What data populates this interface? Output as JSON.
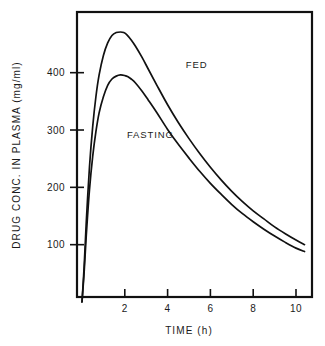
{
  "chart_data": {
    "type": "line",
    "title": "",
    "xlabel": "TIME (h)",
    "ylabel": "DRUG CONC. IN PLASMA  (mg/ml)",
    "xlim": [
      0,
      10.4
    ],
    "ylim": [
      0,
      520
    ],
    "xticks": [
      2,
      4,
      6,
      8,
      10
    ],
    "xtick_labels": [
      "2",
      "4",
      "6",
      "8",
      "10"
    ],
    "yticks": [
      100,
      200,
      300,
      400
    ],
    "ytick_labels": [
      "100",
      "200",
      "300",
      "400"
    ],
    "grid": false,
    "legend": "inline-annotations",
    "line_color": "#111111",
    "frame_color": "#111111",
    "background": "#ffffff",
    "annotations": [
      {
        "text": "FED",
        "x": 4.85,
        "y": 408
      },
      {
        "text": "FASTING",
        "x": 2.1,
        "y": 286
      }
    ],
    "series": [
      {
        "name": "FED",
        "label": "FED",
        "x": [
          0.0,
          0.1,
          0.2,
          0.35,
          0.5,
          0.65,
          0.8,
          1.0,
          1.2,
          1.4,
          1.6,
          1.8,
          1.95,
          2.1,
          2.3,
          2.5,
          2.8,
          3.1,
          3.5,
          4.0,
          4.5,
          5.0,
          5.5,
          6.0,
          6.5,
          7.0,
          7.5,
          8.0,
          8.5,
          9.0,
          9.5,
          10.0,
          10.4
        ],
        "y": [
          0,
          62,
          140,
          236,
          306,
          358,
          396,
          430,
          452,
          465,
          470,
          471,
          470,
          466,
          457,
          446,
          427,
          406,
          378,
          344,
          313,
          285,
          259,
          235,
          213,
          193,
          175,
          159,
          145,
          131,
          119,
          108,
          100
        ]
      },
      {
        "name": "FASTING",
        "label": "FASTING",
        "x": [
          0.0,
          0.1,
          0.2,
          0.35,
          0.5,
          0.65,
          0.8,
          1.0,
          1.2,
          1.4,
          1.6,
          1.8,
          2.0,
          2.15,
          2.3,
          2.5,
          2.8,
          3.1,
          3.5,
          4.0,
          4.5,
          5.0,
          5.5,
          6.0,
          6.5,
          7.0,
          7.5,
          8.0,
          8.5,
          9.0,
          9.5,
          10.0,
          10.4
        ],
        "y": [
          0,
          52,
          116,
          196,
          254,
          297,
          330,
          358,
          378,
          389,
          394,
          396,
          395,
          393,
          389,
          382,
          368,
          352,
          330,
          301,
          275,
          251,
          228,
          207,
          188,
          170,
          154,
          140,
          127,
          115,
          104,
          94,
          88
        ]
      }
    ]
  },
  "axes": {
    "x_title": "TIME (h)",
    "y_title": "DRUG CONC. IN PLASMA  (mg/ml)"
  }
}
